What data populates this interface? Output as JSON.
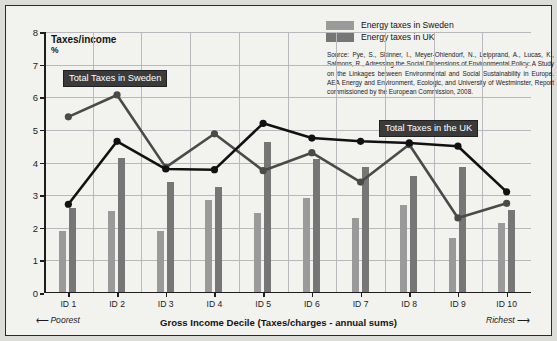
{
  "chart_data": {
    "type": "bar",
    "title": "Taxes/income",
    "subtitle": "%",
    "ylabel": "Taxes/income %",
    "xlabel": "Gross Income Decile (Taxes/charges - annual sums)",
    "categories": [
      "ID 1",
      "ID 2",
      "ID 3",
      "ID 4",
      "ID 5",
      "ID 6",
      "ID 7",
      "ID 8",
      "ID 9",
      "ID 10"
    ],
    "ylim": [
      0,
      8
    ],
    "yticks": [
      0,
      1,
      2,
      3,
      4,
      5,
      6,
      7,
      8
    ],
    "grid": true,
    "legend_position": "top-right",
    "series": [
      {
        "name": "Energy taxes in Sweden",
        "type": "bar",
        "color": "#9a9a9a",
        "values": [
          1.9,
          2.5,
          1.9,
          2.85,
          2.45,
          2.9,
          2.3,
          2.7,
          1.7,
          2.15
        ]
      },
      {
        "name": "Energy taxes in UK",
        "type": "bar",
        "color": "#767676",
        "values": [
          2.6,
          4.15,
          3.4,
          3.25,
          4.62,
          4.1,
          3.85,
          3.6,
          3.85,
          2.55
        ]
      },
      {
        "name": "Total Taxes in Sweden",
        "type": "line",
        "color": "#4a4a4a",
        "values": [
          5.4,
          6.07,
          3.85,
          4.88,
          3.75,
          4.3,
          3.4,
          4.55,
          2.3,
          2.75
        ]
      },
      {
        "name": "Total Taxes in the UK",
        "type": "line",
        "color": "#111111",
        "values": [
          2.72,
          4.65,
          3.8,
          3.78,
          5.2,
          4.75,
          4.65,
          4.6,
          4.5,
          3.1
        ]
      }
    ],
    "annotations": [
      {
        "text": "Total Taxes in Sweden"
      },
      {
        "text": "Total Taxes in the UK"
      }
    ],
    "axis_endcaps": {
      "left": "Poorest",
      "right": "Richest"
    },
    "source": "Source: Pye, S., Skinner, I., Meyer-Ohlendorf, N., Leipprand, A., Lucas, K., Salmons, R., Adressing the Social Dimensions of Environmental Policy: A Study on the Linkages between Environmental and Social Sustainability in Europe. AEA Energy and Environment, Ecologic, and University of Westminster, Report commissioned by the European Commission, 2008."
  },
  "legend": {
    "items": [
      {
        "label": "Energy taxes in Sweden",
        "swatch": "se"
      },
      {
        "label": "Energy taxes in UK",
        "swatch": "uk"
      }
    ]
  },
  "axis": {
    "y_title": "Taxes/income",
    "y_unit": "%",
    "x_title": "Gross Income Decile (Taxes/charges - annual sums)",
    "poorest": "Poorest",
    "richest": "Richest",
    "arrow_left": "⟵",
    "arrow_right": "⟶"
  },
  "callouts": {
    "sweden": "Total Taxes in Sweden",
    "uk": "Total Taxes in the UK"
  },
  "source_text": "Source: Pye, S., Skinner, I., Meyer-Ohlendorf, N., Leipprand, A., Lucas, K., Salmons, R., Adressing the Social Dimensions of Environmental Policy: A Study on the Linkages between Environmental and Social Sustainability in Europe. AEA Energy and Environment, Ecologic, and University of Westminster, Report commissioned by the European Commission, 2008."
}
